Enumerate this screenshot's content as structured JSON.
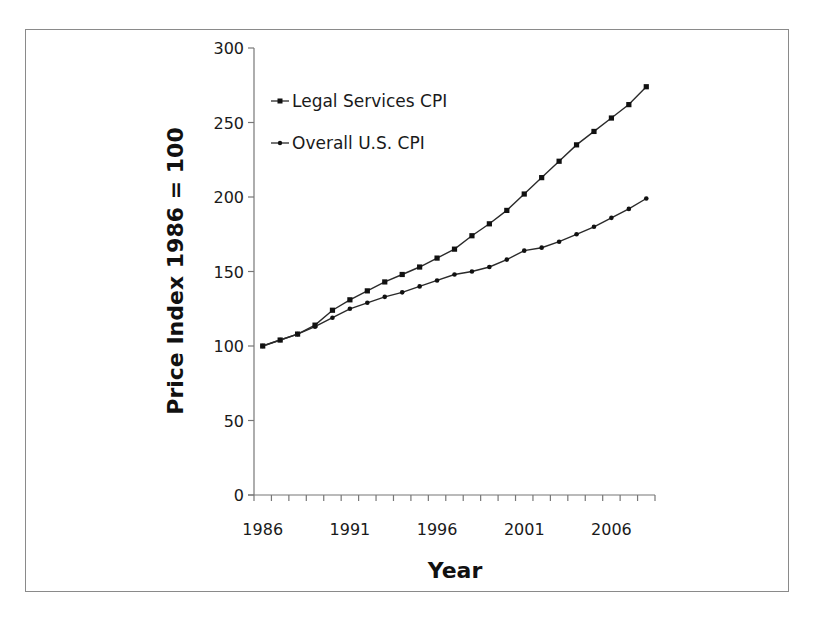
{
  "chart_data": {
    "type": "line",
    "title": "",
    "xlabel": "Year",
    "ylabel": "Price Index 1986 = 100",
    "ylim": [
      0,
      300
    ],
    "yticks": [
      0,
      50,
      100,
      150,
      200,
      250,
      300
    ],
    "xtick_labels": [
      "1986",
      "1991",
      "1996",
      "2001",
      "2006"
    ],
    "grid": false,
    "legend_position": "upper-left",
    "x": [
      1986,
      1987,
      1988,
      1989,
      1990,
      1991,
      1992,
      1993,
      1994,
      1995,
      1996,
      1997,
      1998,
      1999,
      2000,
      2001,
      2002,
      2003,
      2004,
      2005,
      2006,
      2007,
      2008
    ],
    "series": [
      {
        "name": "Legal Services CPI",
        "marker": "square",
        "values": [
          100,
          104,
          108,
          114,
          124,
          131,
          137,
          143,
          148,
          153,
          159,
          165,
          174,
          182,
          191,
          202,
          213,
          224,
          235,
          244,
          253,
          262,
          274
        ]
      },
      {
        "name": "Overall U.S. CPI",
        "marker": "dot",
        "values": [
          100,
          104,
          108,
          113,
          119,
          125,
          129,
          133,
          136,
          140,
          144,
          148,
          150,
          153,
          158,
          164,
          166,
          170,
          175,
          180,
          186,
          192,
          199
        ]
      }
    ]
  },
  "colors": {
    "line": "#2a2a2a",
    "frame": "#8a8a8a"
  }
}
